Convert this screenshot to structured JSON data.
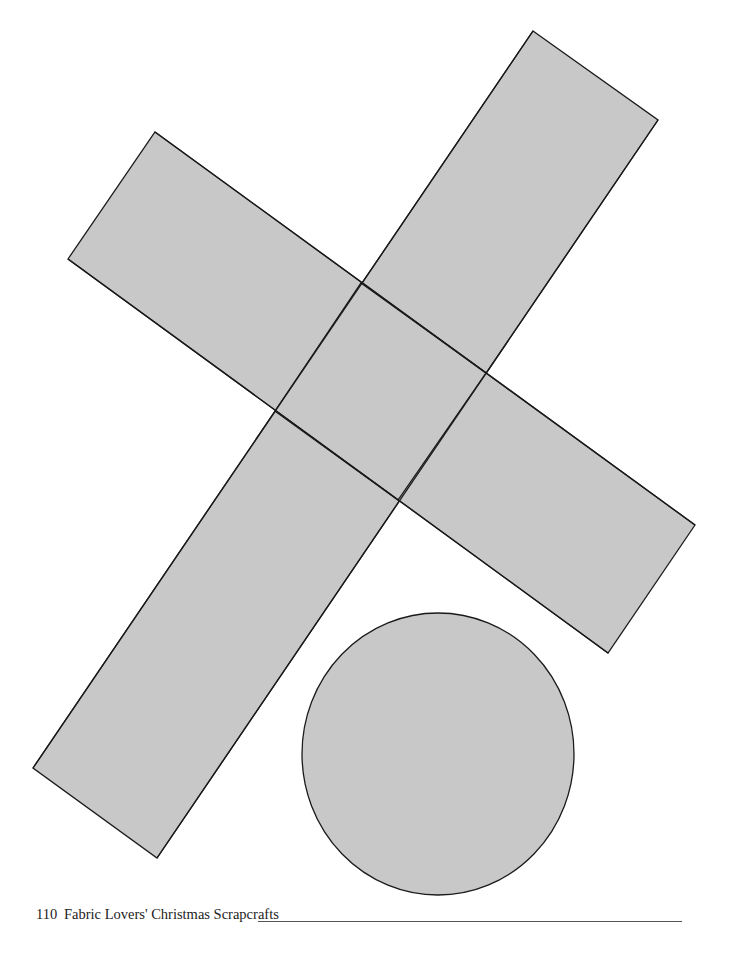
{
  "page": {
    "number": "110",
    "book_title": "Fabric Lovers' Christmas Scrapcrafts"
  },
  "pattern": {
    "fill_color": "#c8c8c8",
    "stroke_color": "#1a1a1a",
    "pieces": [
      {
        "name": "cross-bar-a",
        "points": "533,31 658,120 398,500 275,411"
      },
      {
        "name": "cross-bar-b",
        "points": "155,132 486,373 695,525 608,653 275,411 68,259"
      },
      {
        "name": "cross-bar-c",
        "points": "275,411 398,500 157,858 33,768"
      },
      {
        "name": "center-square",
        "points": "361,283 486,373 398,500 275,411"
      }
    ],
    "circle": {
      "cx": 438,
      "cy": 754,
      "rx": 136,
      "ry": 141
    }
  }
}
